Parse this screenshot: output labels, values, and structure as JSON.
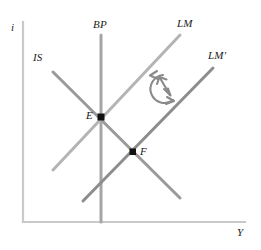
{
  "figure": {
    "type": "economics-diagram",
    "model": "IS-LM-BP (Mundell-Fleming)",
    "background_color": "#ffffff",
    "axes": {
      "y_label": "i",
      "x_label": "Y",
      "color": "#c9c9c9",
      "origin": [
        23,
        222
      ],
      "y_top": [
        23,
        22
      ],
      "x_right": [
        245,
        222
      ]
    },
    "curves": [
      {
        "name": "IS",
        "label": "IS",
        "color": "#9a9a9a",
        "slope": "downward",
        "x1": 53,
        "y1": 72,
        "x2": 180,
        "y2": 198,
        "label_x": 33,
        "label_y": 52
      },
      {
        "name": "BP",
        "label": "BP",
        "color": "#9a9a9a",
        "slope": "vertical",
        "x1": 101,
        "y1": 35,
        "x2": 101,
        "y2": 222,
        "label_x": 93,
        "label_y": 19
      },
      {
        "name": "LM",
        "label": "LM",
        "color": "#b0b0b0",
        "slope": "upward",
        "x1": 53,
        "y1": 170,
        "x2": 180,
        "y2": 35,
        "label_x": 177,
        "label_y": 18
      },
      {
        "name": "LM-prime",
        "label": "LM′",
        "color": "#8a8a8a",
        "slope": "upward",
        "x1": 83,
        "y1": 201,
        "x2": 213,
        "y2": 68,
        "label_x": 208,
        "label_y": 50
      }
    ],
    "points": [
      {
        "name": "E",
        "label": "E",
        "x": 101,
        "y": 117,
        "label_x": 86,
        "label_y": 110,
        "color": "#111111",
        "description": "intersection of IS, BP and LM"
      },
      {
        "name": "F",
        "label": "F",
        "x": 133,
        "y": 152,
        "label_x": 140,
        "label_y": 149,
        "color": "#111111",
        "description": "intersection of IS and LM-prime"
      }
    ],
    "annotation": {
      "name": "adjustment-arrow",
      "kind": "circular-counterclockwise-arrow-with-double-headed-arrow",
      "color": "#8a8a8a",
      "center_x": 164,
      "center_y": 88,
      "radius": 14
    }
  }
}
